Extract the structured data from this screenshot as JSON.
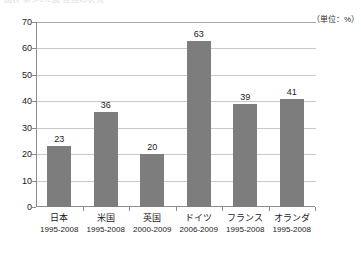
{
  "caption": {
    "text": "図表 第3-1-2図 各国の状況"
  },
  "unit": {
    "label": "（単位：%）"
  },
  "chart_data": {
    "type": "bar",
    "title": "",
    "xlabel": "",
    "ylabel": "",
    "unit": "%",
    "unit_label": "（単位：%）",
    "ylim": [
      0,
      70
    ],
    "yticks": [
      0,
      10,
      20,
      30,
      40,
      50,
      60,
      70
    ],
    "grid": true,
    "legend": "none",
    "bar_color": "#7d7d7d",
    "categories": [
      "日本",
      "米国",
      "英国",
      "ドイツ",
      "フランス",
      "オランダ"
    ],
    "period_labels": [
      "1995-2008",
      "1995-2008",
      "2000-2009",
      "2006-2009",
      "1995-2008",
      "1995-2008"
    ],
    "values": [
      23,
      36,
      20,
      63,
      39,
      41
    ],
    "items": [
      {
        "category": "日本",
        "period": "1995-2008",
        "value": 23,
        "value_label": "23"
      },
      {
        "category": "米国",
        "period": "1995-2008",
        "value": 36,
        "value_label": "36"
      },
      {
        "category": "英国",
        "period": "2000-2009",
        "value": 20,
        "value_label": "20"
      },
      {
        "category": "ドイツ",
        "period": "2006-2009",
        "value": 63,
        "value_label": "63"
      },
      {
        "category": "フランス",
        "period": "1995-2008",
        "value": 39,
        "value_label": "39"
      },
      {
        "category": "オランダ",
        "period": "1995-2008",
        "value": 41,
        "value_label": "41"
      }
    ]
  }
}
